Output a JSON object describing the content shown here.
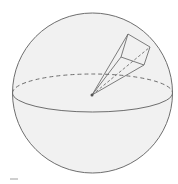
{
  "figure": {
    "colors": {
      "background": "#ffffff",
      "sphere_fill": "#f1f1f1",
      "stroke": "#6e6e6e"
    },
    "sphere": {
      "cx": 92.5,
      "cy": 93,
      "r": 80
    },
    "equator": {
      "cx": 92.5,
      "cy": 93,
      "rx": 80,
      "ry": 19
    },
    "center_point": {
      "x": 92,
      "y": 95
    },
    "pyramid": {
      "apex": [
        92,
        95
      ],
      "base": [
        [
          128,
          34
        ],
        [
          150,
          47
        ],
        [
          144,
          65
        ],
        [
          121,
          57
        ]
      ]
    }
  }
}
